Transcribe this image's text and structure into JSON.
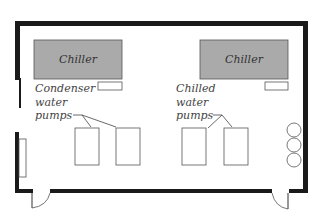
{
  "diagram": {
    "type": "floor-plan",
    "chillers": [
      {
        "label": "Chiller",
        "side": "left"
      },
      {
        "label": "Chiller",
        "side": "right"
      }
    ],
    "labels": {
      "condenser": [
        "Condenser",
        "water",
        "pumps"
      ],
      "chilled": [
        "Chilled",
        "water",
        "pumps"
      ]
    },
    "colors": {
      "wall": "#1a1a1a",
      "chiller_fill": "#aaaaaa",
      "outline": "#555555",
      "background": "#ffffff"
    }
  }
}
